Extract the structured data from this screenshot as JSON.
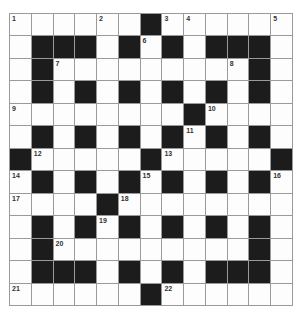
{
  "puzzle": {
    "rows": 13,
    "cols": 13,
    "layout": [
      "WWWWWWBWWWWWW",
      "WBBBWBWBWBBBW",
      "WBWWWWWWWWWBW",
      "WBWBWBWBWBWBW",
      "WWWWWWWWBWWWW",
      "WBWBWBWBWBWBW",
      "BWWWWWBWWWWWB",
      "WBWBWBWBWBWBW",
      "WWWWBWWWWWWWW",
      "WBWBWBWBWBWBW",
      "WBWWWWWWWWWBW",
      "WBBBWBWBWBBBW",
      "WWWWWWBWWWWWW"
    ],
    "numbers": [
      {
        "r": 0,
        "c": 0,
        "n": "1"
      },
      {
        "r": 0,
        "c": 4,
        "n": "2"
      },
      {
        "r": 0,
        "c": 7,
        "n": "3"
      },
      {
        "r": 0,
        "c": 8,
        "n": "4"
      },
      {
        "r": 0,
        "c": 12,
        "n": "5"
      },
      {
        "r": 1,
        "c": 6,
        "n": "6"
      },
      {
        "r": 2,
        "c": 2,
        "n": "7"
      },
      {
        "r": 2,
        "c": 10,
        "n": "8"
      },
      {
        "r": 4,
        "c": 0,
        "n": "9"
      },
      {
        "r": 4,
        "c": 9,
        "n": "10"
      },
      {
        "r": 5,
        "c": 8,
        "n": "11"
      },
      {
        "r": 6,
        "c": 1,
        "n": "12"
      },
      {
        "r": 6,
        "c": 7,
        "n": "13"
      },
      {
        "r": 7,
        "c": 0,
        "n": "14"
      },
      {
        "r": 7,
        "c": 6,
        "n": "15"
      },
      {
        "r": 7,
        "c": 12,
        "n": "16"
      },
      {
        "r": 8,
        "c": 0,
        "n": "17"
      },
      {
        "r": 8,
        "c": 5,
        "n": "18"
      },
      {
        "r": 9,
        "c": 4,
        "n": "19"
      },
      {
        "r": 10,
        "c": 2,
        "n": "20"
      },
      {
        "r": 12,
        "c": 0,
        "n": "21"
      },
      {
        "r": 12,
        "c": 7,
        "n": "22"
      }
    ]
  }
}
